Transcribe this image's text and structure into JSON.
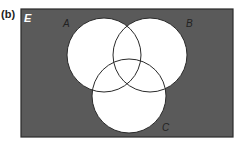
{
  "panel_label": "(b)",
  "diagram": {
    "type": "venn",
    "universal_set_label": "E",
    "sets": [
      {
        "label": "A",
        "cx": 104,
        "cy": 55,
        "r": 37
      },
      {
        "label": "B",
        "cx": 150,
        "cy": 55,
        "r": 37
      },
      {
        "label": "C",
        "cx": 129,
        "cy": 96,
        "r": 37
      }
    ],
    "shaded_region": "complement of (A ∪ B ∪ C)",
    "colors": {
      "background_shade": "#5a5a5a",
      "circle_fill": "#ffffff",
      "outline": "#2a2a2a",
      "label": "#222222",
      "universal_label": "#ffffff"
    }
  }
}
